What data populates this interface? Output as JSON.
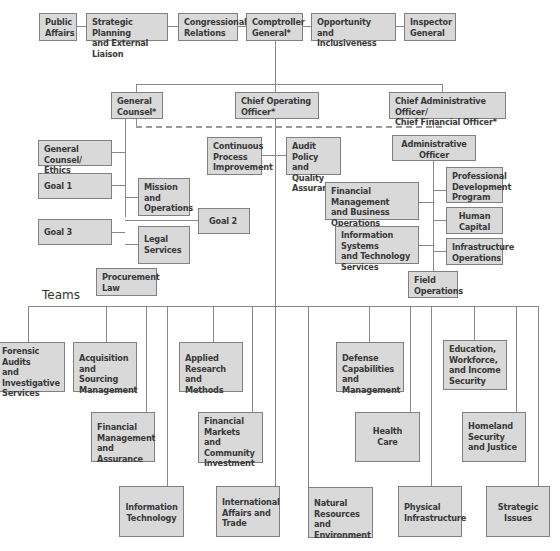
{
  "top_row": [
    {
      "id": "public-affairs",
      "label": "Public\nAffairs"
    },
    {
      "id": "strategic-planning",
      "label": "Strategic Planning\nand External Liaison"
    },
    {
      "id": "congressional-relations",
      "label": "Congressional\nRelations"
    },
    {
      "id": "comptroller-general",
      "label": "Comptroller\nGeneral*"
    },
    {
      "id": "opportunity-inclusiveness",
      "label": "Opportunity and\nInclusiveness"
    },
    {
      "id": "inspector-general",
      "label": "Inspector\nGeneral"
    }
  ],
  "second_row": [
    {
      "id": "general-counsel",
      "label": "General\nCounsel*"
    },
    {
      "id": "chief-operating-officer",
      "label": "Chief Operating\nOfficer*"
    },
    {
      "id": "cao-cfo",
      "label": "Chief Administrative Officer/\nChief Financial Officer*"
    }
  ],
  "general_counsel_units": [
    {
      "id": "gc-ethics",
      "label": "General Counsel/\nEthics Counselor"
    },
    {
      "id": "goal-1",
      "label": "Goal 1"
    },
    {
      "id": "mission-operations",
      "label": "Mission\nand\nOperations"
    },
    {
      "id": "goal-2",
      "label": "Goal 2"
    },
    {
      "id": "goal-3",
      "label": "Goal 3"
    },
    {
      "id": "legal-services",
      "label": "Legal\nServices"
    },
    {
      "id": "procurement-law",
      "label": "Procurement\nLaw"
    }
  ],
  "coo_units": [
    {
      "id": "continuous-process",
      "label": "Continuous\nProcess\nImprovement"
    },
    {
      "id": "audit-policy",
      "label": "Audit Policy\nand Quality\nAssurance"
    }
  ],
  "cao_units": [
    {
      "id": "administrative-officer",
      "label": "Administrative\nOfficer"
    },
    {
      "id": "professional-development",
      "label": "Professional\nDevelopment\nProgram"
    },
    {
      "id": "financial-management-business",
      "label": "Financial Management\nand Business\nOperations"
    },
    {
      "id": "human-capital",
      "label": "Human\nCapital"
    },
    {
      "id": "information-systems",
      "label": "Information Systems\nand Technology\nServices"
    },
    {
      "id": "infrastructure-operations",
      "label": "Infrastructure\nOperations"
    },
    {
      "id": "field-operations",
      "label": "Field\nOperations"
    }
  ],
  "teams_heading": "Teams",
  "teams": [
    {
      "id": "forensic-audits",
      "label": "Forensic\nAudits\nand Investigative\nServices"
    },
    {
      "id": "acquisition-sourcing",
      "label": "Acquisition\nand Sourcing\nManagement"
    },
    {
      "id": "financial-management-assurance",
      "label": "Financial\nManagement\nand Assurance"
    },
    {
      "id": "information-technology",
      "label": "Information\nTechnology"
    },
    {
      "id": "applied-research",
      "label": "Applied\nResearch and\nMethods"
    },
    {
      "id": "financial-markets",
      "label": "Financial\nMarkets and\nCommunity\nInvestment"
    },
    {
      "id": "international-affairs",
      "label": "International\nAffairs and\nTrade"
    },
    {
      "id": "natural-resources",
      "label": "Natural\nResources and\nEnvironment"
    },
    {
      "id": "defense-capabilities",
      "label": "Defense\nCapabilities and\nManagement"
    },
    {
      "id": "health-care",
      "label": "Health\nCare"
    },
    {
      "id": "physical-infrastructure",
      "label": "Physical\nInfrastructure"
    },
    {
      "id": "education-workforce",
      "label": "Education,\nWorkforce,\nand Income\nSecurity"
    },
    {
      "id": "homeland-security",
      "label": "Homeland\nSecurity\nand Justice"
    },
    {
      "id": "strategic-issues",
      "label": "Strategic\nIssues"
    }
  ],
  "colors": {
    "box_fill": "#d9d9d9",
    "box_border": "#808080",
    "line": "#888888"
  }
}
